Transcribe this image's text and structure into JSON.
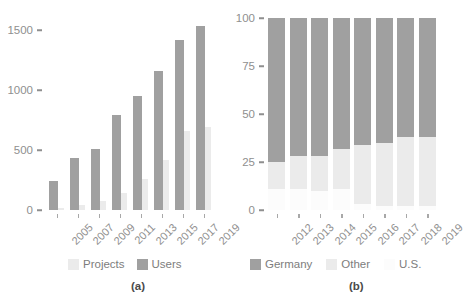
{
  "colors": {
    "users": "#a0a0a0",
    "projects": "#ebebeb",
    "germany": "#a0a0a0",
    "other": "#ebebeb",
    "us": "#fcfcfc",
    "axis": "#8f8f8f",
    "tick": "#a8a8a8",
    "tag": "#4a4a4a"
  },
  "panel_a": {
    "tag": "(a)",
    "legend": [
      {
        "label": "Projects",
        "color": "#ebebeb"
      },
      {
        "label": "Users",
        "color": "#a0a0a0"
      }
    ],
    "yticks": [
      "0",
      "500",
      "1000",
      "1500"
    ],
    "xticks": [
      "2005",
      "2007",
      "2009",
      "2011",
      "2013",
      "2015",
      "2017",
      "2019"
    ]
  },
  "panel_b": {
    "tag": "(b)",
    "legend": [
      {
        "label": "Germany",
        "color": "#a0a0a0"
      },
      {
        "label": "Other",
        "color": "#ebebeb"
      },
      {
        "label": "U.S.",
        "color": "#fcfcfc"
      }
    ],
    "yticks": [
      "0",
      "25",
      "50",
      "75",
      "100"
    ],
    "xticks": [
      "2012",
      "2013",
      "2014",
      "2015",
      "2016",
      "2017",
      "2018",
      "2019"
    ]
  },
  "chart_data": [
    {
      "type": "bar",
      "panel": "(a)",
      "title": "",
      "xlabel": "",
      "ylabel": "",
      "ylim": [
        0,
        1600
      ],
      "yticks": [
        0,
        500,
        1000,
        1500
      ],
      "grid": false,
      "legend_position": "bottom",
      "categories": [
        "2005",
        "2007",
        "2009",
        "2011",
        "2013",
        "2015",
        "2017",
        "2019"
      ],
      "series": [
        {
          "name": "Users",
          "color": "#a0a0a0",
          "values": [
            245,
            430,
            505,
            790,
            950,
            1155,
            1420,
            1530
          ]
        },
        {
          "name": "Projects",
          "color": "#ebebeb",
          "values": [
            20,
            45,
            75,
            140,
            260,
            420,
            660,
            690
          ]
        }
      ]
    },
    {
      "type": "bar",
      "subtype": "stacked-100",
      "panel": "(b)",
      "title": "",
      "xlabel": "",
      "ylabel": "",
      "ylim": [
        0,
        100
      ],
      "yticks": [
        0,
        25,
        50,
        75,
        100
      ],
      "grid": false,
      "legend_position": "bottom",
      "categories": [
        "2012",
        "2013",
        "2014",
        "2015",
        "2016",
        "2017",
        "2018",
        "2019"
      ],
      "series": [
        {
          "name": "U.S.",
          "color": "#fcfcfc",
          "values": [
            11,
            11,
            10,
            11,
            3,
            2,
            2,
            2
          ]
        },
        {
          "name": "Other",
          "color": "#ebebeb",
          "values": [
            14,
            17,
            18,
            21,
            31,
            33,
            36,
            36
          ]
        },
        {
          "name": "Germany",
          "color": "#a0a0a0",
          "values": [
            75,
            72,
            72,
            68,
            66,
            65,
            62,
            62
          ]
        }
      ]
    }
  ]
}
